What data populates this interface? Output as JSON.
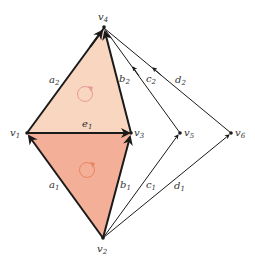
{
  "vertices": [
    {
      "id": "v1",
      "label": "v",
      "sub": "1"
    },
    {
      "id": "v2",
      "label": "v",
      "sub": "2"
    },
    {
      "id": "v3",
      "label": "v",
      "sub": "3"
    },
    {
      "id": "v4",
      "label": "v",
      "sub": "4"
    },
    {
      "id": "v5",
      "label": "v",
      "sub": "5"
    },
    {
      "id": "v6",
      "label": "v",
      "sub": "6"
    }
  ],
  "edges": [
    {
      "id": "a2",
      "label": "a",
      "sub": "2",
      "from": "v1",
      "to": "v4",
      "weight": "thick"
    },
    {
      "id": "b2",
      "label": "b",
      "sub": "2",
      "from": "v3",
      "to": "v4",
      "weight": "thick"
    },
    {
      "id": "c2",
      "label": "c",
      "sub": "2",
      "from": "v5",
      "to": "v4",
      "weight": "thin"
    },
    {
      "id": "d2",
      "label": "d",
      "sub": "2",
      "from": "v6",
      "to": "v4",
      "weight": "thin"
    },
    {
      "id": "e1",
      "label": "e",
      "sub": "1",
      "from": "v1",
      "to": "v3",
      "weight": "thick"
    },
    {
      "id": "a1",
      "label": "a",
      "sub": "1",
      "from": "v2",
      "to": "v1",
      "weight": "thick"
    },
    {
      "id": "b1",
      "label": "b",
      "sub": "1",
      "from": "v2",
      "to": "v3",
      "weight": "thick"
    },
    {
      "id": "c1",
      "label": "c",
      "sub": "1",
      "from": "v2",
      "to": "v5",
      "weight": "thin"
    },
    {
      "id": "d1",
      "label": "d",
      "sub": "1",
      "from": "v2",
      "to": "v6",
      "weight": "thin"
    }
  ],
  "faces": [
    {
      "id": "upper-face",
      "vertices": [
        "v1",
        "v3",
        "v4"
      ],
      "fill": "#F9D6BF",
      "orientation_color": "#E79A9A"
    },
    {
      "id": "lower-face",
      "vertices": [
        "v1",
        "v2",
        "v3"
      ],
      "fill": "#F3AF98",
      "orientation_color": "#E8865F"
    }
  ],
  "colors": {
    "edge": "#1a1a1a"
  }
}
